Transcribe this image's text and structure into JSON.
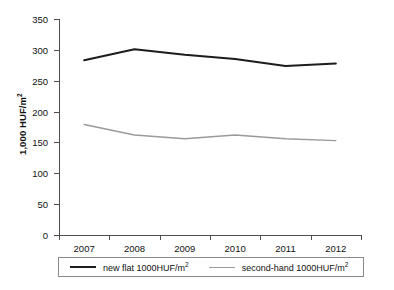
{
  "chart_data": {
    "type": "line",
    "title": "",
    "xlabel": "",
    "ylabel": "1,000 HUF/m²",
    "categories": [
      "2007",
      "2008",
      "2009",
      "2010",
      "2011",
      "2012"
    ],
    "ylim": [
      0,
      350
    ],
    "yticks": [
      0,
      50,
      100,
      150,
      200,
      250,
      300,
      350
    ],
    "grid": false,
    "legend_position": "bottom",
    "series": [
      {
        "name": "new flat 1000HUF/m²",
        "color": "#1c1c1c",
        "values": [
          283,
          301,
          292,
          285,
          274,
          278
        ]
      },
      {
        "name": "second-hand 1000HUF/m²",
        "color": "#9a9a9a",
        "values": [
          179,
          162,
          156,
          162,
          156,
          153
        ]
      }
    ]
  },
  "axes": {
    "y_title": "1,000 HUF/m²",
    "y_tick_labels": [
      "350",
      "300",
      "250",
      "200",
      "150",
      "100",
      "50",
      "0"
    ],
    "x_tick_labels": [
      "2007",
      "2008",
      "2009",
      "2010",
      "2011",
      "2012"
    ]
  },
  "legend": {
    "entries": [
      {
        "label_main": "new flat 1000HUF/m",
        "label_sup": "2"
      },
      {
        "label_main": "second-hand 1000HUF/m",
        "label_sup": "2"
      }
    ]
  }
}
